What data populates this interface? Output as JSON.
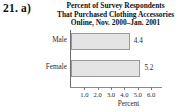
{
  "problem": {
    "label": "21. a)"
  },
  "chart_data": {
    "type": "bar",
    "orientation": "horizontal",
    "title": "Percent of Survey Respondents That Purchased Clothing Accessories Online, Nov. 2000–Jan. 2001",
    "title_lines": [
      "Percent of Survey Respondents",
      "That Purchased Clothing Accessories",
      "Online, Nov. 2000–Jan. 2001"
    ],
    "categories": [
      "Male",
      "Female"
    ],
    "values": [
      4.4,
      5.2
    ],
    "value_labels": [
      "4.4",
      "5.2"
    ],
    "xlabel": "Percent",
    "ylabel": "",
    "xlim": [
      0,
      6.5
    ],
    "xticks": [
      1.0,
      2.0,
      3.0,
      4.0,
      5.0,
      6.0
    ],
    "xtick_labels": [
      "1.0",
      "2.0",
      "3.0",
      "4.0",
      "5.0",
      "6.0"
    ],
    "grid": false,
    "legend": false,
    "colors": {
      "bar_fill": "#e4e4e4",
      "bar_border": "#9a9a9a",
      "axis": "#6e6e6e",
      "text": "#2b2b2b",
      "background": "#ffffff"
    }
  }
}
